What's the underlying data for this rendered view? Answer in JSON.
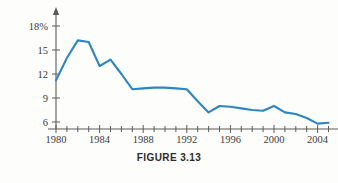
{
  "figure": {
    "caption": "FIGURE 3.13"
  },
  "chart_data": {
    "type": "line",
    "title": "",
    "subtitle": "",
    "xlabel": "",
    "ylabel": "",
    "xlim": [
      1980,
      2005
    ],
    "ylim": [
      5,
      19
    ],
    "grid": false,
    "legend": null,
    "legend_position": "none",
    "line_color": "#2e86c1",
    "axis_color": "#5b5b5b",
    "background_color": "#fdfdfb",
    "y_ticks": [
      6,
      9,
      12,
      15,
      18
    ],
    "y_tick_labels": [
      "6",
      "9",
      "12",
      "15",
      "18%"
    ],
    "x_ticks": [
      1980,
      1981,
      1982,
      1983,
      1984,
      1985,
      1986,
      1987,
      1988,
      1989,
      1990,
      1991,
      1992,
      1993,
      1994,
      1995,
      1996,
      1997,
      1998,
      1999,
      2000,
      2001,
      2002,
      2003,
      2004,
      2005
    ],
    "x_labeled_ticks": [
      1980,
      1984,
      1988,
      1992,
      1996,
      2000,
      2004
    ],
    "x_tick_labels": [
      "1980",
      "1984",
      "1988",
      "1992",
      "1996",
      "2000",
      "2004"
    ],
    "x": [
      1980,
      1981,
      1982,
      1983,
      1984,
      1985,
      1986,
      1987,
      1988,
      1989,
      1990,
      1991,
      1992,
      1993,
      1994,
      1995,
      1996,
      1997,
      1998,
      1999,
      2000,
      2001,
      2002,
      2003,
      2004,
      2005
    ],
    "values": [
      11.2,
      14.0,
      16.2,
      16.0,
      13.0,
      13.8,
      12.0,
      10.1,
      10.2,
      10.3,
      10.3,
      10.2,
      10.1,
      8.6,
      7.2,
      8.0,
      7.9,
      7.7,
      7.5,
      7.4,
      8.0,
      7.2,
      7.0,
      6.5,
      5.8,
      5.9
    ],
    "series": [
      {
        "name": "rate",
        "values": [
          11.2,
          14.0,
          16.2,
          16.0,
          13.0,
          13.8,
          12.0,
          10.1,
          10.2,
          10.3,
          10.3,
          10.2,
          10.1,
          8.6,
          7.2,
          8.0,
          7.9,
          7.7,
          7.5,
          7.4,
          8.0,
          7.2,
          7.0,
          6.5,
          5.8,
          5.9
        ]
      }
    ],
    "annotations": []
  }
}
